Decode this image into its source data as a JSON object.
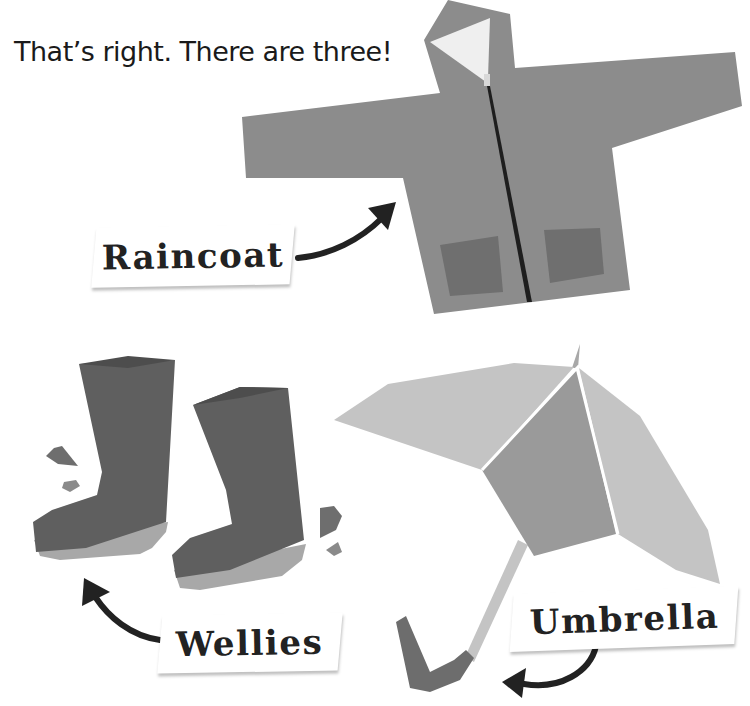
{
  "headline": "That’s right. There are three!",
  "labels": {
    "raincoat": "Raincoat",
    "wellies": "Wellies",
    "umbrella": "Umbrella"
  },
  "colors": {
    "background": "#ffffff",
    "coat": "#8c8c8c",
    "coat_pocket": "#6f6f6f",
    "hood_lining": "#efefef",
    "zip": "#1e1e1e",
    "boot": "#5f5f5f",
    "boot_sole": "#a8a8a8",
    "splash": "#6e6e6e",
    "umbrella_light": "#c4c4c4",
    "umbrella_mid": "#9a9a9a",
    "umbrella_handle": "#6d6d6d",
    "arrow": "#222222",
    "text": "#1a1a1a"
  }
}
